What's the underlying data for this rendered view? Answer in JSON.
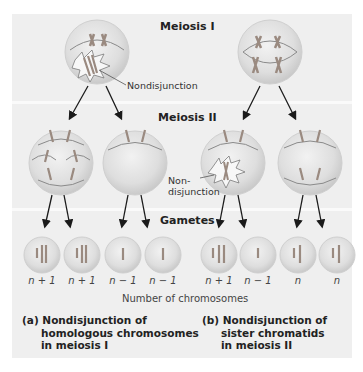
{
  "stages": {
    "meiosis1": "Meiosis I",
    "meiosis2": "Meiosis II",
    "gametes": "Gametes"
  },
  "annotations": {
    "nondisjunction_a": "Nondisjunction",
    "nondisjunction_b_line1": "Non-",
    "nondisjunction_b_line2": "disjunction"
  },
  "gametes": {
    "a": [
      "n + 1",
      "n + 1",
      "n − 1",
      "n − 1"
    ],
    "b": [
      "n + 1",
      "n − 1",
      "n",
      "n"
    ]
  },
  "axis_caption": "Number of chromosomes",
  "captions": {
    "a": {
      "prefix": "(a)",
      "line1": "Nondisjunction of",
      "line2": "homologous chromosomes",
      "line3": "in meiosis I"
    },
    "b": {
      "prefix": "(b)",
      "line1": "Nondisjunction of",
      "line2": "sister chromatids",
      "line3": "in meiosis II"
    }
  },
  "colors": {
    "band_bg": "#eeeeee",
    "cell_fill": "#e2e2e2",
    "chromosome": "#9a8a80",
    "arrow": "#1a1a1a"
  }
}
